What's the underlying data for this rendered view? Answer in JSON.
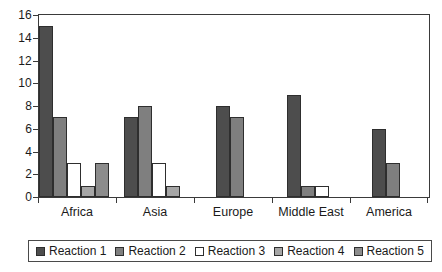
{
  "chart_data": {
    "type": "bar",
    "title": "",
    "subtitle": "",
    "xlabel": "",
    "ylabel": "",
    "grid": false,
    "legend_position": "bottom",
    "categories": [
      "Africa",
      "Asia",
      "Europe",
      "Middle East",
      "America"
    ],
    "ylim": [
      0,
      16
    ],
    "ytick_labels": [
      "0",
      "2",
      "4",
      "6",
      "8",
      "10",
      "12",
      "14",
      "16"
    ],
    "ytick_values": [
      0,
      2,
      4,
      6,
      8,
      10,
      12,
      14,
      16
    ],
    "series": [
      {
        "name": "Reaction 1",
        "color": "#4d4d4d",
        "values": [
          15,
          7,
          8,
          9,
          6
        ]
      },
      {
        "name": "Reaction 2",
        "color": "#7f7f7f",
        "values": [
          7,
          8,
          7,
          1,
          3
        ]
      },
      {
        "name": "Reaction 3",
        "color": "#ffffff",
        "values": [
          3,
          3,
          0,
          1,
          0
        ]
      },
      {
        "name": "Reaction 4",
        "color": "#a6a6a6",
        "values": [
          1,
          1,
          0,
          0,
          0
        ]
      },
      {
        "name": "Reaction 5",
        "color": "#8c8c8c",
        "values": [
          3,
          0,
          0,
          0,
          0
        ]
      }
    ]
  },
  "colors": {
    "axis": "#3a3a3a",
    "bar_outline": "#2e2e2e",
    "text": "#1a1a1a",
    "background": "#ffffff",
    "legend_border": "#4a4a4a"
  }
}
